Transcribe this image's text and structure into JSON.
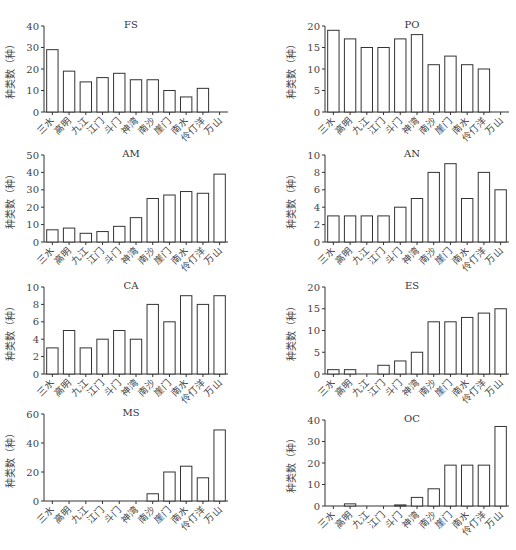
{
  "chart_data": [
    {
      "type": "bar",
      "title": "FS",
      "xlabel": "",
      "ylabel": "种类数（种）",
      "ylim": [
        0,
        40
      ],
      "yticks": [
        0,
        10,
        20,
        30,
        40
      ],
      "categories": [
        "三水",
        "高明",
        "九江",
        "江门",
        "斗门",
        "神湾",
        "南沙",
        "崖门",
        "南水",
        "伶仃洋",
        "万山"
      ],
      "values": [
        29,
        19,
        14,
        16,
        18,
        15,
        15,
        10,
        7,
        11,
        0
      ],
      "grid": false,
      "legend": null
    },
    {
      "type": "bar",
      "title": "PO",
      "xlabel": "",
      "ylabel": "种类数（种）",
      "ylim": [
        0,
        20
      ],
      "yticks": [
        0,
        5,
        10,
        15,
        20
      ],
      "categories": [
        "三水",
        "高明",
        "九江",
        "江门",
        "斗门",
        "神湾",
        "南沙",
        "崖门",
        "南水",
        "伶仃洋",
        "万山"
      ],
      "values": [
        19,
        17,
        15,
        15,
        17,
        18,
        11,
        13,
        11,
        10,
        0
      ],
      "grid": false,
      "legend": null
    },
    {
      "type": "bar",
      "title": "AM",
      "xlabel": "",
      "ylabel": "种类数（种）",
      "ylim": [
        0,
        50
      ],
      "yticks": [
        0,
        10,
        20,
        30,
        40,
        50
      ],
      "categories": [
        "三水",
        "高明",
        "九江",
        "江门",
        "斗门",
        "神湾",
        "南沙",
        "崖门",
        "南水",
        "伶仃洋",
        "万山"
      ],
      "values": [
        7,
        8,
        5,
        6,
        9,
        14,
        25,
        27,
        29,
        28,
        39
      ],
      "grid": false,
      "legend": null
    },
    {
      "type": "bar",
      "title": "AN",
      "xlabel": "",
      "ylabel": "种类数（种）",
      "ylim": [
        0,
        10
      ],
      "yticks": [
        0,
        2,
        4,
        6,
        8,
        10
      ],
      "categories": [
        "三水",
        "高明",
        "九江",
        "江门",
        "斗门",
        "神湾",
        "南沙",
        "崖门",
        "南水",
        "伶仃洋",
        "万山"
      ],
      "values": [
        3,
        3,
        3,
        3,
        4,
        5,
        8,
        9,
        5,
        8,
        6
      ],
      "grid": false,
      "legend": null
    },
    {
      "type": "bar",
      "title": "CA",
      "xlabel": "",
      "ylabel": "种类数（种）",
      "ylim": [
        0,
        10
      ],
      "yticks": [
        0,
        2,
        4,
        6,
        8,
        10
      ],
      "categories": [
        "三水",
        "高明",
        "九江",
        "江门",
        "斗门",
        "神湾",
        "南沙",
        "崖门",
        "南水",
        "伶仃洋",
        "万山"
      ],
      "values": [
        3,
        5,
        3,
        4,
        5,
        4,
        8,
        6,
        9,
        8,
        9
      ],
      "grid": false,
      "legend": null
    },
    {
      "type": "bar",
      "title": "ES",
      "xlabel": "",
      "ylabel": "种类数（种）",
      "ylim": [
        0,
        20
      ],
      "yticks": [
        0,
        5,
        10,
        15,
        20
      ],
      "categories": [
        "三水",
        "高明",
        "九江",
        "江门",
        "斗门",
        "神湾",
        "南沙",
        "崖门",
        "南水",
        "伶仃洋",
        "万山"
      ],
      "values": [
        1,
        1,
        0,
        2,
        3,
        5,
        12,
        12,
        13,
        14,
        15
      ],
      "grid": false,
      "legend": null
    },
    {
      "type": "bar",
      "title": "MS",
      "xlabel": "",
      "ylabel": "种类数（种）",
      "ylim": [
        0,
        60
      ],
      "yticks": [
        0,
        20,
        40,
        60
      ],
      "categories": [
        "三水",
        "高明",
        "九江",
        "江门",
        "斗门",
        "神湾",
        "南沙",
        "崖门",
        "南水",
        "伶仃洋",
        "万山"
      ],
      "values": [
        0,
        0,
        0,
        0,
        0,
        0,
        5,
        20,
        24,
        16,
        49
      ],
      "grid": false,
      "legend": null
    },
    {
      "type": "bar",
      "title": "OC",
      "xlabel": "",
      "ylabel": "种类数（种）",
      "ylim": [
        0,
        40
      ],
      "yticks": [
        0,
        10,
        20,
        30,
        40
      ],
      "categories": [
        "三水",
        "高明",
        "九江",
        "江门",
        "斗门",
        "神湾",
        "南沙",
        "崖门",
        "南水",
        "伶仃洋",
        "万山"
      ],
      "values": [
        0,
        1,
        0,
        0,
        0.5,
        4,
        8,
        19,
        19,
        19,
        37
      ],
      "grid": false,
      "legend": null
    }
  ],
  "layout": {
    "panels": [
      {
        "left": 0,
        "top": 0,
        "axisX": 44,
        "axisEnd": 228,
        "yTop": 26,
        "yBottom": 112
      },
      {
        "left": 0,
        "top": 0,
        "axisX": 325,
        "axisEnd": 509,
        "yTop": 26,
        "yBottom": 112
      },
      {
        "left": 0,
        "top": 0,
        "axisX": 44,
        "axisEnd": 228,
        "yTop": 155,
        "yBottom": 242
      },
      {
        "left": 0,
        "top": 0,
        "axisX": 325,
        "axisEnd": 509,
        "yTop": 155,
        "yBottom": 242
      },
      {
        "left": 0,
        "top": 0,
        "axisX": 44,
        "axisEnd": 228,
        "yTop": 287,
        "yBottom": 374
      },
      {
        "left": 0,
        "top": 0,
        "axisX": 325,
        "axisEnd": 509,
        "yTop": 287,
        "yBottom": 374
      },
      {
        "left": 0,
        "top": 0,
        "axisX": 44,
        "axisEnd": 228,
        "yTop": 414,
        "yBottom": 501
      },
      {
        "left": 0,
        "top": 0,
        "axisX": 325,
        "axisEnd": 509,
        "yTop": 420,
        "yBottom": 506
      }
    ]
  },
  "style": {
    "bar_fill": "#ffffff",
    "bar_stroke": "#333333",
    "axis_color": "#333333"
  }
}
